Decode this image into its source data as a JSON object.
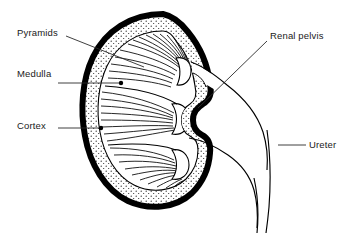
{
  "figure": {
    "type": "anatomical-line-diagram",
    "background_color": "#ffffff",
    "line_color": "#000000",
    "stipple_color": "#1a1a1a",
    "capsule_stroke_width_px": 6
  },
  "labels": {
    "pyramids": "Pyramids",
    "medulla": "Medulla",
    "cortex": "Cortex",
    "renal_pelvis": "Renal pelvis",
    "ureter": "Ureter"
  },
  "leaders": [
    {
      "label": "Pyramids",
      "style": "diagonal-line",
      "from": [
        66,
        36
      ],
      "to": [
        144,
        67
      ],
      "endpoint_marker": "none"
    },
    {
      "label": "Medulla",
      "style": "horizontal-line",
      "from": [
        58,
        83
      ],
      "to": [
        120,
        83
      ],
      "endpoint_marker": "dot"
    },
    {
      "label": "Cortex",
      "style": "horizontal-line",
      "from": [
        58,
        128
      ],
      "to": [
        101,
        128
      ],
      "endpoint_marker": "dot"
    },
    {
      "label": "Renal pelvis",
      "style": "diagonal-line",
      "from": [
        267,
        41
      ],
      "to": [
        198,
        108
      ],
      "endpoint_marker": "none"
    },
    {
      "label": "Ureter",
      "style": "horizontal-line",
      "from": [
        278,
        145
      ],
      "to": [
        306,
        145
      ],
      "endpoint_marker": "none"
    }
  ],
  "structures": [
    {
      "name": "renal-capsule",
      "description": "thick black outer outline of the kidney"
    },
    {
      "name": "cortex",
      "description": "stippled band just inside the capsule"
    },
    {
      "name": "medulla",
      "description": "region of radiating striations inside the cortex"
    },
    {
      "name": "renal-pyramids",
      "description": "fan-shaped striated triangles converging on the pelvis"
    },
    {
      "name": "renal-papillae",
      "description": "rounded tips of pyramids projecting into the pelvis"
    },
    {
      "name": "renal-pelvis",
      "description": "open funnel-shaped cavity at the hilum"
    },
    {
      "name": "ureter",
      "description": "tube descending from the pelvis out of the frame"
    }
  ]
}
